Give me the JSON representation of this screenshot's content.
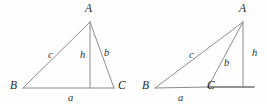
{
  "figure": {
    "caption": "",
    "background_color": "#fefefe",
    "line_color": "#8c8c8c",
    "label_color": "#2b2b2b",
    "diagrams": [
      {
        "name": "acute-triangle",
        "description": "Triangle ABC with altitude h from A meeting base BC between B and C",
        "vertices": {
          "A": {
            "label": "A",
            "x": 90,
            "y": 22
          },
          "B": {
            "label": "B",
            "x": 23,
            "y": 88
          },
          "C": {
            "label": "C",
            "x": 114,
            "y": 88
          }
        },
        "altitude_foot": {
          "x": 90,
          "y": 88
        },
        "side_labels": {
          "c": {
            "label": "c",
            "x": 48,
            "y": 50
          },
          "h": {
            "label": "h",
            "x": 80,
            "y": 50
          },
          "b": {
            "label": "b",
            "x": 104,
            "y": 48
          },
          "a": {
            "label": "a",
            "x": 68,
            "y": 93
          }
        },
        "vertex_label_positions": {
          "A": {
            "x": 85,
            "y": 3
          },
          "B": {
            "x": 10,
            "y": 80
          },
          "C": {
            "x": 118,
            "y": 80
          }
        }
      },
      {
        "name": "obtuse-triangle",
        "description": "Triangle ABC obtuse at C with altitude h from A falling outside onto the extension of BC",
        "vertices": {
          "A": {
            "label": "A",
            "x": 243,
            "y": 22
          },
          "B": {
            "label": "B",
            "x": 155,
            "y": 88
          },
          "C": {
            "label": "C",
            "x": 208,
            "y": 87
          }
        },
        "altitude_foot": {
          "x": 243,
          "y": 87
        },
        "base_extension_end": {
          "x": 254,
          "y": 87
        },
        "side_labels": {
          "c": {
            "label": "c",
            "x": 189,
            "y": 50
          },
          "b": {
            "label": "b",
            "x": 224,
            "y": 58
          },
          "h": {
            "label": "h",
            "x": 252,
            "y": 48
          },
          "a": {
            "label": "a",
            "x": 178,
            "y": 93
          }
        },
        "vertex_label_positions": {
          "A": {
            "x": 239,
            "y": 3
          },
          "B": {
            "x": 142,
            "y": 80
          },
          "C": {
            "x": 207,
            "y": 80
          }
        }
      }
    ]
  }
}
